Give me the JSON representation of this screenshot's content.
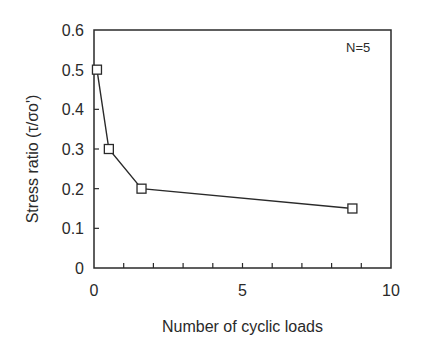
{
  "chart_data": {
    "type": "line",
    "title": "",
    "xlabel": "Number of cyclic loads",
    "ylabel": "Stress ratio (τ/σo')",
    "xlim": [
      0,
      10
    ],
    "ylim": [
      0,
      0.6
    ],
    "xticks": [
      0,
      5,
      10
    ],
    "xtick_labels": [
      "0",
      "5",
      "10"
    ],
    "xminor_step": 1,
    "yticks": [
      0,
      0.1,
      0.2,
      0.3,
      0.4,
      0.5,
      0.6
    ],
    "ytick_labels": [
      "0",
      "0.1",
      "0.2",
      "0.3",
      "0.4",
      "0.5",
      "0.6"
    ],
    "grid": false,
    "legend": null,
    "annotations": [
      {
        "text": "N=5",
        "position": "top-right"
      }
    ],
    "series": [
      {
        "name": "N=5",
        "marker": "square-open",
        "color": "#2a2a2a",
        "x": [
          0.1,
          0.5,
          1.6,
          8.7
        ],
        "y": [
          0.5,
          0.3,
          0.2,
          0.15
        ]
      }
    ]
  },
  "colors": {
    "axis": "#2a2a2a",
    "line": "#2a2a2a",
    "background": "#ffffff"
  }
}
